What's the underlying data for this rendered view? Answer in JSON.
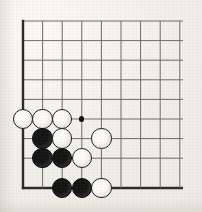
{
  "board": {
    "kind": "go-board-corner-diagram",
    "title": "Go board corner position",
    "visible_columns": 9,
    "visible_rows": 9,
    "geometry": {
      "origin_x": 23,
      "origin_y": 21,
      "spacing": 19.6,
      "bottom_edge_y": 188,
      "right_extent_x": 183,
      "stone_radius": 10.2,
      "edge_line_width": 2.4,
      "inner_line_width": 1.0,
      "hoshi_radius": 2.6
    },
    "colors": {
      "paper": "#f1efe9",
      "line": "#6d6b66",
      "edge_line": "#2a2a2a",
      "black_stone": "#141414",
      "white_stone_fill": "#fcfbf8",
      "white_stone_edge": "#1b1b1b",
      "hoshi": "#111111"
    },
    "edges": [
      {
        "name": "left-edge",
        "orientation": "vertical",
        "col": 0
      },
      {
        "name": "bottom-edge",
        "orientation": "horizontal",
        "row": 8
      }
    ],
    "markers": [
      {
        "name": "hoshi-star-point",
        "col": 3,
        "row": 5,
        "label": "4-4 star point"
      }
    ],
    "stones": [
      {
        "color": "white",
        "col": 0,
        "row": 5
      },
      {
        "color": "white",
        "col": 1,
        "row": 5
      },
      {
        "color": "white",
        "col": 2,
        "row": 5
      },
      {
        "color": "black",
        "col": 1,
        "row": 6
      },
      {
        "color": "white",
        "col": 2,
        "row": 6
      },
      {
        "color": "white",
        "col": 4,
        "row": 6
      },
      {
        "color": "black",
        "col": 1,
        "row": 7
      },
      {
        "color": "black",
        "col": 2,
        "row": 7
      },
      {
        "color": "white",
        "col": 3,
        "row": 7
      },
      {
        "color": "black",
        "col": 2,
        "row": 8
      },
      {
        "color": "black",
        "col": 3,
        "row": 8
      },
      {
        "color": "white",
        "col": 4,
        "row": 8
      }
    ],
    "counts": {
      "black_stones": 5,
      "white_stones": 7,
      "total_stones": 12
    }
  }
}
